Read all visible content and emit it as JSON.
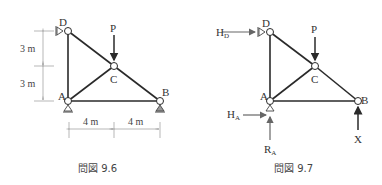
{
  "figures": [
    {
      "caption": "問図 9.6",
      "nodes": {
        "A": "A",
        "B": "B",
        "C": "C",
        "D": "D"
      },
      "load": "P",
      "dimensions": {
        "v1": "3 m",
        "v2": "3 m",
        "h1": "4 m",
        "h2": "4 m"
      }
    },
    {
      "caption": "問図 9.7",
      "nodes": {
        "A": "A",
        "B": "B",
        "C": "C",
        "D": "D"
      },
      "load": "P",
      "reactions": {
        "HD": {
          "main": "H",
          "sub": "D"
        },
        "HA": {
          "main": "H",
          "sub": "A"
        },
        "RA": {
          "main": "R",
          "sub": "A"
        },
        "X": "X"
      }
    }
  ],
  "colors": {
    "member": "#2a2a2a",
    "dimension": "#999999",
    "arrow": "#555555"
  }
}
